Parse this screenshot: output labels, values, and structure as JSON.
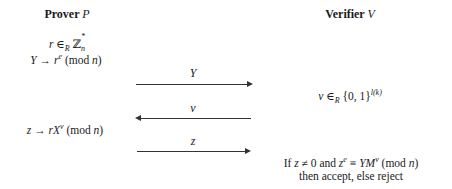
{
  "prover": {
    "title": "Prover",
    "symbol": "P",
    "step1": {
      "var": "r",
      "rel": " ∈",
      "rel_sub": "R",
      "set": " ℤ",
      "set_sup": "*",
      "set_sub": "n"
    },
    "step2": {
      "lhs": "Y",
      "arrow": " → ",
      "base": "r",
      "exp": "e",
      "mod": "  (mod ",
      "mod_var": "n",
      "close": ")"
    },
    "step3": {
      "lhs": "z",
      "arrow": " → ",
      "base": "rX",
      "exp": "v",
      "mod": "  (mod ",
      "mod_var": "n",
      "close": ")"
    }
  },
  "verifier": {
    "title": "Verifier",
    "symbol": "V",
    "challenge": {
      "var": "v",
      "rel": " ∈",
      "rel_sub": "R",
      "set": " {0, 1}",
      "set_sup": "l(k)"
    },
    "check_line1": {
      "if": "If ",
      "z": "z",
      "neq": " ≠ 0 and ",
      "z2": "z",
      "exp": "e",
      "equiv": " ≡ ",
      "ym": "YM",
      "exp2": "v",
      "mod": "  (mod ",
      "mod_var": "n",
      "close": ")"
    },
    "check_line2": "then accept, else reject"
  },
  "messages": [
    {
      "label": "Y",
      "direction": "right"
    },
    {
      "label": "v",
      "direction": "left"
    },
    {
      "label": "z",
      "direction": "right"
    }
  ]
}
